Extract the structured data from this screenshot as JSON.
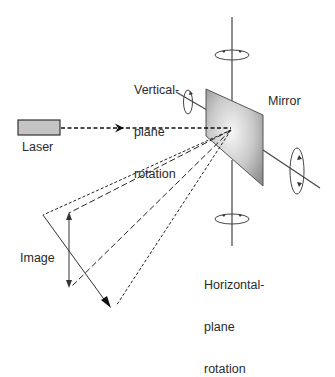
{
  "diagram": {
    "labels": {
      "laser": "Laser",
      "mirror": "Mirror",
      "image": "Image",
      "vertical_rotation": [
        "Vertical-",
        "plane",
        "rotation"
      ],
      "horizontal_rotation": [
        "Horizontal-",
        "plane",
        "rotation"
      ]
    },
    "colors": {
      "stroke": "#333333",
      "laser_fill": "#c4c4c4",
      "mirror_light": "#f4f4f4",
      "mirror_dark": "#8f8f8f"
    }
  }
}
